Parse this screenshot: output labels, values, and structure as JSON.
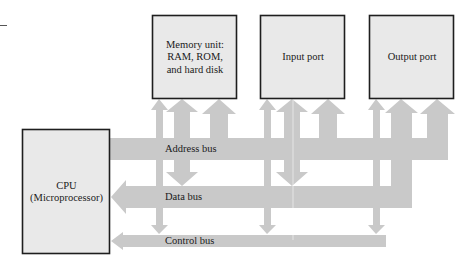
{
  "diagram": {
    "colors": {
      "bus_fill": "#c9c9c9",
      "box_fill": "#e9e9e9",
      "box_stroke": "#1e1e1e",
      "text": "#1a1a1a"
    },
    "components": {
      "cpu": {
        "line1": "CPU",
        "line2": "(Microprocessor)"
      },
      "memory": {
        "line1": "Memory unit:",
        "line2": "RAM, ROM,",
        "line3": "and hard disk"
      },
      "input_port": {
        "label": "Input port"
      },
      "output_port": {
        "label": "Output port"
      }
    },
    "buses": {
      "address": {
        "label": "Address bus",
        "direction": "CPU to devices"
      },
      "data": {
        "label": "Data bus",
        "direction": "bidirectional"
      },
      "control": {
        "label": "Control bus",
        "direction": "to CPU"
      }
    },
    "connections": [
      {
        "device": "memory",
        "address": "up",
        "data": "up/down",
        "control": "down"
      },
      {
        "device": "input_port",
        "address": "up",
        "data": "up/down",
        "control": "down"
      },
      {
        "device": "output_port",
        "address": "up",
        "data": "up",
        "control": "down"
      }
    ]
  }
}
